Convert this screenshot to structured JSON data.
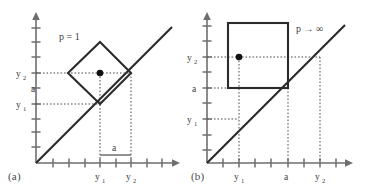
{
  "figure": {
    "type": "diagram",
    "background_color": "#ffffff",
    "line_color": "#2b2b2b",
    "axis_color": "#6e6e6e",
    "guide_color": "#4a4a4a"
  },
  "panels": [
    {
      "id": "a",
      "caption": "(a)",
      "norm_label": "p = 1",
      "shape": "diamond",
      "origin": {
        "x": 36,
        "y": 163
      },
      "axis": {
        "x_length": 140,
        "y_length": 155,
        "tick_spacing": 15.6,
        "x_ticks": 8,
        "y_ticks": 9
      },
      "diagonal": {
        "label": "y = x",
        "from": [
          36,
          163
        ],
        "to": [
          172,
          27
        ]
      },
      "center_point": {
        "x": 100,
        "y": 73
      },
      "y_axis_labels": [
        {
          "text": "y",
          "sub": "2",
          "value_px": 73
        },
        {
          "text": "a",
          "sub": "",
          "value_px": 88
        },
        {
          "text": "y",
          "sub": "1",
          "value_px": 104
        }
      ],
      "x_axis_labels": [
        {
          "text": "y",
          "sub": "1",
          "value_px": 100
        },
        {
          "text": "a",
          "sub": "",
          "value_px": 116
        },
        {
          "text": "y",
          "sub": "2",
          "value_px": 131
        }
      ]
    },
    {
      "id": "b",
      "caption": "(b)",
      "norm_label": "p → ∞",
      "shape": "square",
      "origin": {
        "x": 207,
        "y": 163
      },
      "axis": {
        "x_length": 143,
        "y_length": 155,
        "tick_spacing": 15.6,
        "x_ticks": 8,
        "y_ticks": 9
      },
      "diagonal": {
        "label": "y = x",
        "from": [
          207,
          163
        ],
        "to": [
          345,
          25
        ]
      },
      "center_point": {
        "x": 239,
        "y": 57
      },
      "square_bounds": {
        "left": 228,
        "right": 288,
        "top": 23,
        "bottom": 88
      },
      "y_axis_labels": [
        {
          "text": "y",
          "sub": "2",
          "value_px": 57
        },
        {
          "text": "a",
          "sub": "",
          "value_px": 88
        },
        {
          "text": "y",
          "sub": "1",
          "value_px": 119
        }
      ],
      "x_axis_labels": [
        {
          "text": "y",
          "sub": "1",
          "value_px": 239
        },
        {
          "text": "a",
          "sub": "",
          "value_px": 288
        },
        {
          "text": "y",
          "sub": "2",
          "value_px": 320
        }
      ]
    }
  ],
  "labels": {
    "panel_a_caption": "(a)",
    "panel_b_caption": "(b)",
    "panel_a_norm": "p = 1",
    "panel_b_norm": "p → ∞",
    "y1": "y",
    "y2": "y",
    "sub1": "1",
    "sub2": "2",
    "a": "a"
  }
}
